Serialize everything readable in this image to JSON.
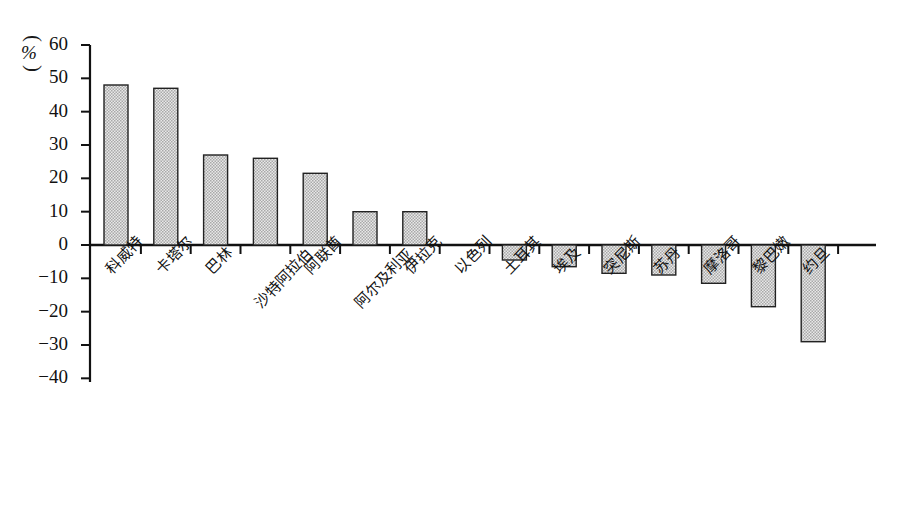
{
  "chart_data": {
    "type": "bar",
    "title": "",
    "subtitle": "",
    "xlabel": "",
    "ylabel": "",
    "unit_label": "%",
    "ylim": [
      -40,
      60
    ],
    "ytick_step": 10,
    "yticks": [
      60,
      50,
      40,
      30,
      20,
      10,
      0,
      -10,
      -20,
      -30,
      -40
    ],
    "ytick_labels": [
      "60",
      "50",
      "40",
      "30",
      "20",
      "10",
      "0",
      "−10",
      "−20",
      "−30",
      "−40"
    ],
    "grid": false,
    "legend": "none",
    "categories": [
      "科威特",
      "卡塔尔",
      "巴林",
      "沙特阿拉伯",
      "阿联酋",
      "阿尔及利亚",
      "伊拉克",
      "以色列",
      "土耳其",
      "埃及",
      "突尼斯",
      "苏丹",
      "摩洛哥",
      "黎巴嫩",
      "约旦"
    ],
    "values": [
      48,
      47,
      27,
      26,
      21.5,
      10,
      10,
      0,
      -4.5,
      -6.5,
      -8.5,
      -9,
      -11.5,
      -18.5,
      -29
    ],
    "bar_fill_color": "#c9c9c9",
    "bar_edge_color": "#222222",
    "axis_color": "#111111"
  }
}
